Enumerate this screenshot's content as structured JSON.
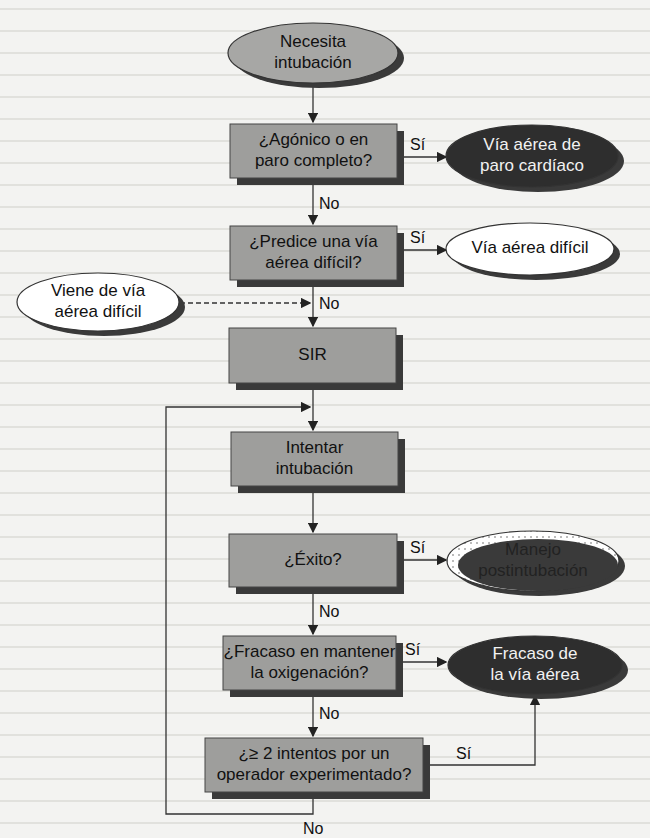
{
  "colors": {
    "process_fill": "#9e9e9c",
    "shadow": "#3a3a3a",
    "terminal_dark": "#2e2e2e",
    "terminal_light": "#ffffff",
    "terminal_grey": "#a7a7a5",
    "line": "#333333"
  },
  "nodes": {
    "start": {
      "lines": [
        "Necesita",
        "intubación"
      ]
    },
    "q_agonal": {
      "lines": [
        "¿Agónico o en",
        "paro completo?"
      ]
    },
    "crash": {
      "lines": [
        "Vía aérea de",
        "paro cardíaco"
      ]
    },
    "q_predict": {
      "lines": [
        "¿Predice una vía",
        "aérea difícil?"
      ]
    },
    "difficult": {
      "lines": [
        "Vía aérea difícil"
      ]
    },
    "from_difficult": {
      "lines": [
        "Viene de vía",
        "aérea difícil"
      ]
    },
    "rsi": {
      "lines": [
        "SIR"
      ]
    },
    "attempt": {
      "lines": [
        "Intentar",
        "intubación"
      ]
    },
    "q_success": {
      "lines": [
        "¿Éxito?"
      ]
    },
    "post": {
      "lines": [
        "Manejo",
        "postintubación"
      ]
    },
    "q_oxygen": {
      "lines": [
        "¿Fracaso en mantener",
        "la oxigenación?"
      ]
    },
    "failed": {
      "lines": [
        "Fracaso de",
        "la vía aérea"
      ]
    },
    "q_attempts": {
      "lines": [
        "¿≥ 2 intentos por un",
        "operador experimentado?"
      ]
    }
  },
  "edge_labels": {
    "agonal_yes": "Sí",
    "agonal_no": "No",
    "predict_yes": "Sí",
    "predict_no": "No",
    "success_yes": "Sí",
    "success_no": "No",
    "oxygen_yes": "Sí",
    "oxygen_no": "No",
    "attempts_yes": "Sí",
    "attempts_no": "No"
  }
}
